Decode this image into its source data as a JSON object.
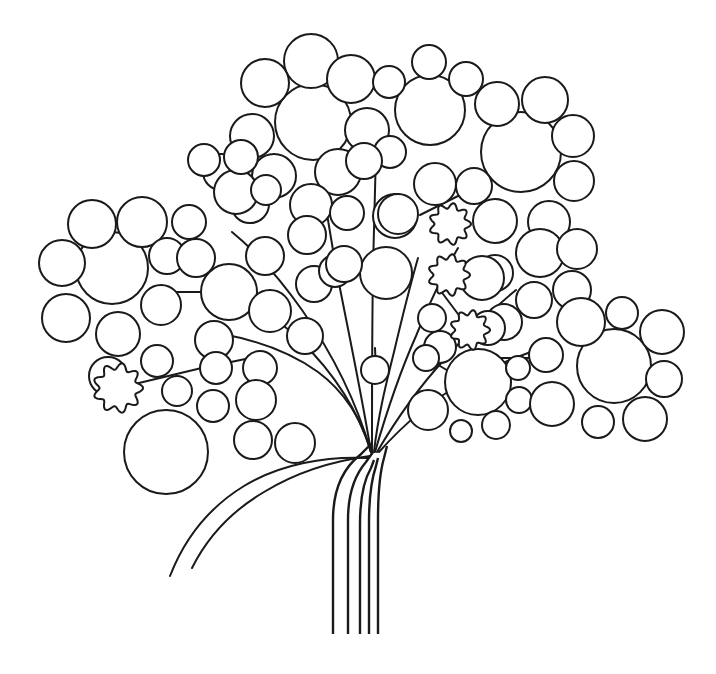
{
  "artwork": {
    "title": "Stylized Circle Tree",
    "type": "line-art-illustration",
    "subject": "tree",
    "width": 716,
    "height": 674,
    "background_color": "#ffffff",
    "stroke_color": "#1a1a1a",
    "fill_color": "#ffffff",
    "stroke_width": 2,
    "style": "black outline on white, no shading, coloring-book style"
  },
  "trunk": {
    "name": "trunk",
    "line_count": 5,
    "stroke_color": "#1a1a1a",
    "bottom_y": 634,
    "fan_origin_x": 372,
    "fan_origin_y": 455,
    "paths": [
      "M 333 634 L 333 520 C 333 492 341 470 360 455 L 372 443",
      "M 348 634 L 348 520 C 348 496 354 476 366 462 L 373 452",
      "M 360 634 L 360 524 C 360 500 364 480 371 468 L 374 460",
      "M 369 634 L 369 522 C 369 498 372 478 376 466 L 378 458",
      "M 378 634 L 378 520 C 378 494 380 472 384 458 L 387 446"
    ]
  },
  "branches": {
    "name": "branch-set",
    "count": 11,
    "description": "curved stems fanning out from the trunk crown to each foliage cluster",
    "paths": [
      "M 371 452 C 362 420 345 392 318 372 C 290 352 255 340 222 334",
      "M 371 452 C 358 410 333 372 300 340 C 270 312 238 292 206 282",
      "M 371 452 C 356 400 330 350 302 310 C 278 276 254 250 232 232",
      "M 371 452 C 362 396 348 330 336 268 C 328 222 322 186 318 160",
      "M 372 452 C 372 400 372 330 373 268 C 374 218 375 180 376 152",
      "M 374 452 C 378 416 386 384 394 352 C 402 318 410 286 418 258",
      "M 375 452 C 386 414 400 372 416 336 C 430 302 444 272 458 248",
      "M 377 452 C 396 420 418 388 444 360 C 470 330 494 308 516 290",
      "M 379 452 C 404 424 432 400 464 382 C 496 364 528 352 556 344",
      "M 370 456 C 340 460 300 470 264 492 C 230 512 206 540 192 568",
      "M 368 458 C 326 456 280 464 244 486 C 208 508 184 540 170 576"
    ],
    "short_connectors": [
      "M 372 370 L 372 400",
      "M 375 348 L 376 370",
      "M 118 388 L 210 366",
      "M 212 366 L 250 358",
      "M 484 358 L 540 358",
      "M 540 358 L 560 358",
      "M 420 215 L 470 190",
      "M 148 292 L 210 292",
      "M 440 290 L 470 330",
      "M 430 360 L 460 378"
    ]
  },
  "foliage": {
    "name": "foliage-clusters",
    "circle_count": 96,
    "blossom_count": 4,
    "clusters": [
      {
        "name": "cluster-top-center-left",
        "hub": {
          "cx": 313,
          "cy": 122,
          "r": 38
        },
        "satellites": [
          {
            "cx": 311,
            "cy": 61,
            "r": 27
          },
          {
            "cx": 265,
            "cy": 83,
            "r": 24
          },
          {
            "cx": 351,
            "cy": 79,
            "r": 24
          },
          {
            "cx": 252,
            "cy": 136,
            "r": 22
          },
          {
            "cx": 367,
            "cy": 130,
            "r": 22
          },
          {
            "cx": 274,
            "cy": 176,
            "r": 22
          },
          {
            "cx": 338,
            "cy": 172,
            "r": 23
          },
          {
            "cx": 311,
            "cy": 205,
            "r": 21
          },
          {
            "cx": 250,
            "cy": 204,
            "r": 19
          },
          {
            "cx": 221,
            "cy": 172,
            "r": 18
          }
        ]
      },
      {
        "name": "cluster-top-right",
        "hub": {
          "cx": 430,
          "cy": 110,
          "r": 35
        },
        "satellites": [
          {
            "cx": 429,
            "cy": 62,
            "r": 17
          },
          {
            "cx": 466,
            "cy": 79,
            "r": 17
          },
          {
            "cx": 389,
            "cy": 82,
            "r": 16
          },
          {
            "cx": 390,
            "cy": 152,
            "r": 16
          },
          {
            "cx": 395,
            "cy": 216,
            "r": 22
          },
          {
            "cx": 435,
            "cy": 184,
            "r": 21
          }
        ]
      },
      {
        "name": "cluster-right-upper",
        "hub": {
          "cx": 521,
          "cy": 152,
          "r": 40
        },
        "satellites": [
          {
            "cx": 497,
            "cy": 104,
            "r": 22
          },
          {
            "cx": 545,
            "cy": 100,
            "r": 23
          },
          {
            "cx": 573,
            "cy": 136,
            "r": 21
          },
          {
            "cx": 574,
            "cy": 181,
            "r": 20
          },
          {
            "cx": 549,
            "cy": 222,
            "r": 21
          },
          {
            "cx": 495,
            "cy": 221,
            "r": 22
          },
          {
            "cx": 474,
            "cy": 186,
            "r": 18
          },
          {
            "cx": 540,
            "cy": 253,
            "r": 24
          },
          {
            "cx": 577,
            "cy": 249,
            "r": 20
          },
          {
            "cx": 572,
            "cy": 290,
            "r": 19
          },
          {
            "cx": 495,
            "cy": 273,
            "r": 18
          },
          {
            "cx": 534,
            "cy": 300,
            "r": 18
          }
        ]
      },
      {
        "name": "cluster-left-main",
        "hub": {
          "cx": 112,
          "cy": 268,
          "r": 36
        },
        "satellites": [
          {
            "cx": 92,
            "cy": 224,
            "r": 24
          },
          {
            "cx": 142,
            "cy": 222,
            "r": 25
          },
          {
            "cx": 62,
            "cy": 263,
            "r": 23
          },
          {
            "cx": 66,
            "cy": 318,
            "r": 24
          },
          {
            "cx": 118,
            "cy": 334,
            "r": 22
          },
          {
            "cx": 161,
            "cy": 305,
            "r": 20
          },
          {
            "cx": 167,
            "cy": 256,
            "r": 18
          },
          {
            "cx": 108,
            "cy": 376,
            "r": 19
          },
          {
            "cx": 157,
            "cy": 361,
            "r": 16
          }
        ]
      },
      {
        "name": "cluster-left-mid",
        "hub": {
          "cx": 229,
          "cy": 292,
          "r": 28
        },
        "satellites": [
          {
            "cx": 196,
            "cy": 258,
            "r": 19
          },
          {
            "cx": 265,
            "cy": 256,
            "r": 19
          },
          {
            "cx": 270,
            "cy": 311,
            "r": 21
          },
          {
            "cx": 214,
            "cy": 340,
            "r": 19
          },
          {
            "cx": 189,
            "cy": 222,
            "r": 17
          },
          {
            "cx": 236,
            "cy": 192,
            "r": 22
          },
          {
            "cx": 204,
            "cy": 160,
            "r": 16
          },
          {
            "cx": 241,
            "cy": 157,
            "r": 17
          },
          {
            "cx": 266,
            "cy": 190,
            "r": 15
          },
          {
            "cx": 307,
            "cy": 235,
            "r": 19
          },
          {
            "cx": 314,
            "cy": 284,
            "r": 18
          },
          {
            "cx": 305,
            "cy": 336,
            "r": 18
          },
          {
            "cx": 260,
            "cy": 368,
            "r": 17
          },
          {
            "cx": 216,
            "cy": 368,
            "r": 16
          },
          {
            "cx": 335,
            "cy": 271,
            "r": 16
          }
        ]
      },
      {
        "name": "cluster-bottom-left",
        "hub": {
          "cx": 166,
          "cy": 452,
          "r": 42
        },
        "satellites": [
          {
            "cx": 256,
            "cy": 400,
            "r": 20
          },
          {
            "cx": 213,
            "cy": 406,
            "r": 16
          },
          {
            "cx": 253,
            "cy": 440,
            "r": 19
          },
          {
            "cx": 295,
            "cy": 443,
            "r": 20
          }
        ]
      },
      {
        "name": "cluster-center-stem",
        "hub": {
          "cx": 375,
          "cy": 370,
          "r": 14
        },
        "satellites": [
          {
            "cx": 386,
            "cy": 273,
            "r": 26
          },
          {
            "cx": 398,
            "cy": 214,
            "r": 20
          },
          {
            "cx": 344,
            "cy": 264,
            "r": 18
          },
          {
            "cx": 347,
            "cy": 213,
            "r": 17
          }
        ]
      },
      {
        "name": "cluster-right-lower",
        "hub": {
          "cx": 478,
          "cy": 382,
          "r": 33
        },
        "satellites": [
          {
            "cx": 440,
            "cy": 347,
            "r": 16
          },
          {
            "cx": 518,
            "cy": 368,
            "r": 12
          },
          {
            "cx": 519,
            "cy": 400,
            "r": 13
          },
          {
            "cx": 496,
            "cy": 425,
            "r": 14
          },
          {
            "cx": 461,
            "cy": 431,
            "r": 11
          },
          {
            "cx": 428,
            "cy": 410,
            "r": 20
          },
          {
            "cx": 426,
            "cy": 358,
            "r": 13
          },
          {
            "cx": 504,
            "cy": 322,
            "r": 18
          }
        ]
      },
      {
        "name": "cluster-far-right",
        "hub": {
          "cx": 614,
          "cy": 366,
          "r": 37
        },
        "satellites": [
          {
            "cx": 581,
            "cy": 322,
            "r": 24
          },
          {
            "cx": 622,
            "cy": 313,
            "r": 16
          },
          {
            "cx": 662,
            "cy": 332,
            "r": 22
          },
          {
            "cx": 664,
            "cy": 379,
            "r": 18
          },
          {
            "cx": 645,
            "cy": 419,
            "r": 22
          },
          {
            "cx": 598,
            "cy": 422,
            "r": 16
          },
          {
            "cx": 552,
            "cy": 404,
            "r": 22
          },
          {
            "cx": 546,
            "cy": 355,
            "r": 17
          }
        ]
      },
      {
        "name": "cluster-loose-fill",
        "hub": null,
        "satellites": [
          {
            "cx": 482,
            "cy": 278,
            "r": 22
          },
          {
            "cx": 488,
            "cy": 328,
            "r": 17
          },
          {
            "cx": 432,
            "cy": 318,
            "r": 14
          },
          {
            "cx": 364,
            "cy": 161,
            "r": 18
          },
          {
            "cx": 177,
            "cy": 391,
            "r": 15
          }
        ]
      }
    ],
    "blossoms": [
      {
        "name": "blossom-left",
        "cx": 118,
        "cy": 388,
        "r": 25,
        "lobes": 9
      },
      {
        "name": "blossom-right-upper",
        "cx": 450,
        "cy": 224,
        "r": 21,
        "lobes": 9
      },
      {
        "name": "blossom-right-middle",
        "cx": 449,
        "cy": 275,
        "r": 21,
        "lobes": 9
      },
      {
        "name": "blossom-right-lower",
        "cx": 470,
        "cy": 330,
        "r": 20,
        "lobes": 9
      }
    ]
  }
}
